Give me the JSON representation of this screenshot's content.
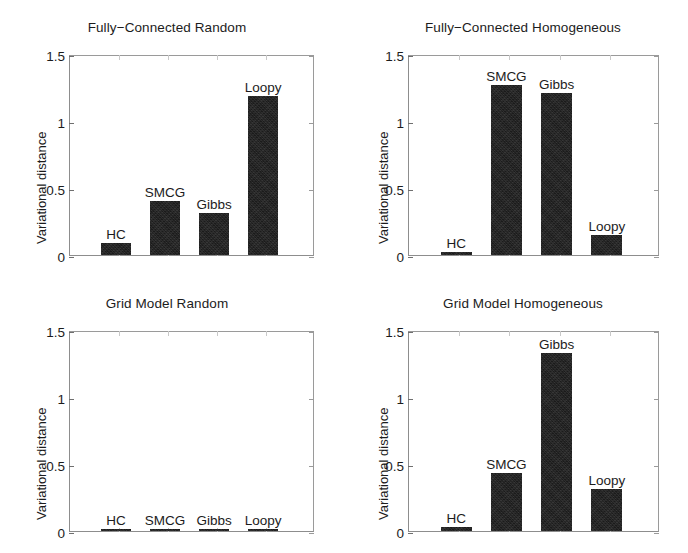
{
  "chart_data": [
    {
      "type": "bar",
      "title": "Fully−Connected Random",
      "xlabel": "",
      "ylabel": "Variational distance",
      "categories": [
        "HC",
        "SMCG",
        "Gibbs",
        "Loopy"
      ],
      "values": [
        0.09,
        0.4,
        0.31,
        1.19
      ],
      "ylim": [
        0,
        1.5
      ],
      "yticks": [
        "0",
        "0.5",
        "1",
        "1.5"
      ],
      "ytick_values": [
        0,
        0.5,
        1,
        1.5
      ],
      "grid": false,
      "legend": "none",
      "bar_color": "#1b1b1b",
      "labels_above_bars": true
    },
    {
      "type": "bar",
      "title": "Fully−Connected Homogeneous",
      "xlabel": "",
      "ylabel": "Variational distance",
      "categories": [
        "HC",
        "SMCG",
        "Gibbs",
        "Loopy"
      ],
      "values": [
        0.02,
        1.27,
        1.21,
        0.15
      ],
      "ylim": [
        0,
        1.5
      ],
      "yticks": [
        "0",
        "0.5",
        "1",
        "1.5"
      ],
      "ytick_values": [
        0,
        0.5,
        1,
        1.5
      ],
      "grid": false,
      "legend": "none",
      "bar_color": "#1b1b1b",
      "labels_above_bars": true
    },
    {
      "type": "bar",
      "title": "Grid Model Random",
      "xlabel": "",
      "ylabel": "Variational distance",
      "categories": [
        "HC",
        "SMCG",
        "Gibbs",
        "Loopy"
      ],
      "values": [
        0.012,
        0.012,
        0.012,
        0.012
      ],
      "ylim": [
        0,
        1.5
      ],
      "yticks": [
        "0",
        "0.5",
        "1",
        "1.5"
      ],
      "ytick_values": [
        0,
        0.5,
        1,
        1.5
      ],
      "grid": false,
      "legend": "none",
      "bar_color": "#1b1b1b",
      "labels_above_bars": true
    },
    {
      "type": "bar",
      "title": "Grid Model Homogeneous",
      "xlabel": "",
      "ylabel": "Variational distance",
      "categories": [
        "HC",
        "SMCG",
        "Gibbs",
        "Loopy"
      ],
      "values": [
        0.03,
        0.43,
        1.33,
        0.31
      ],
      "ylim": [
        0,
        1.5
      ],
      "yticks": [
        "0",
        "0.5",
        "1",
        "1.5"
      ],
      "ytick_values": [
        0,
        0.5,
        1,
        1.5
      ],
      "grid": false,
      "legend": "none",
      "bar_color": "#1b1b1b",
      "labels_above_bars": true
    }
  ]
}
